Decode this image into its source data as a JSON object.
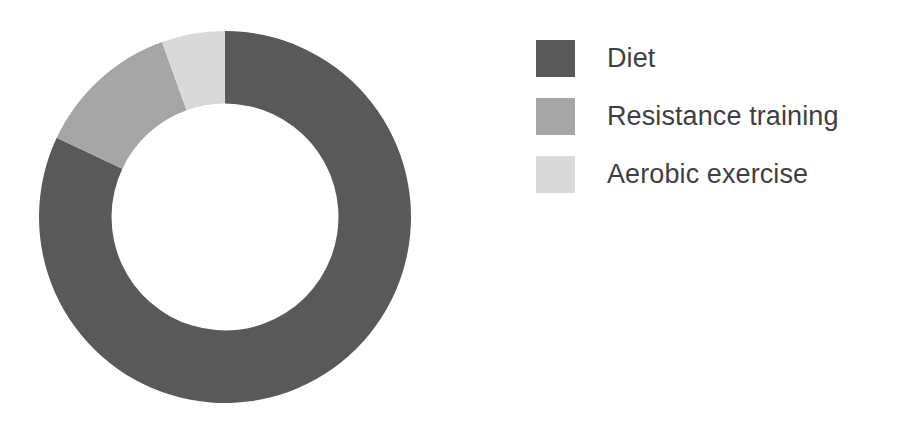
{
  "chart_data": {
    "type": "pie",
    "variant": "donut",
    "title": "",
    "subtitle": "",
    "xlabel": "",
    "ylabel": "",
    "grid": false,
    "legend_position": "right",
    "start_angle_deg": 0,
    "direction": "clockwise",
    "hole_ratio": 0.61,
    "categories": [
      "Diet",
      "Resistance training",
      "Aerobic exercise"
    ],
    "values": [
      82,
      12.5,
      5.5
    ],
    "value_unit": "percent",
    "colors": [
      "#595959",
      "#a5a5a5",
      "#d9d9d9"
    ],
    "slices": [
      {
        "label": "Diet",
        "value": 82,
        "color": "#595959",
        "start_deg": 0,
        "end_deg": 295.2
      },
      {
        "label": "Resistance training",
        "value": 12.5,
        "color": "#a5a5a5",
        "start_deg": 295.2,
        "end_deg": 340.2
      },
      {
        "label": "Aerobic exercise",
        "value": 5.5,
        "color": "#d9d9d9",
        "start_deg": 340.2,
        "end_deg": 360
      }
    ]
  },
  "legend": {
    "items": [
      {
        "label": "Diet",
        "color": "#595959",
        "swatch_name": "legend-swatch-diet"
      },
      {
        "label": "Resistance training",
        "color": "#a5a5a5",
        "swatch_name": "legend-swatch-resistance-training"
      },
      {
        "label": "Aerobic exercise",
        "color": "#d9d9d9",
        "swatch_name": "legend-swatch-aerobic-exercise"
      }
    ]
  },
  "canvas": {
    "background": "#ffffff",
    "text_color": "#3f3f3f"
  }
}
